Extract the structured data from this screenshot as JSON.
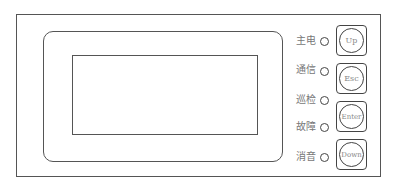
{
  "panel": {
    "indicators": [
      {
        "label": "主电"
      },
      {
        "label": "通信"
      },
      {
        "label": "巡检"
      },
      {
        "label": "故障"
      },
      {
        "label": "消音"
      }
    ],
    "buttons": [
      {
        "label": "Up"
      },
      {
        "label": "Esc"
      },
      {
        "label": "Enter"
      },
      {
        "label": "Down"
      }
    ]
  }
}
